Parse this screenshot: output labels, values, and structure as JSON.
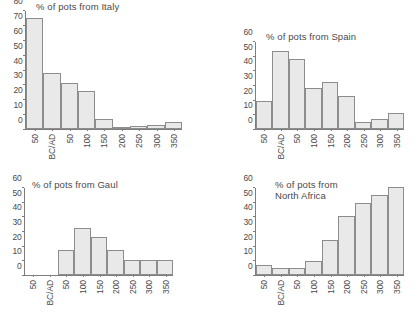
{
  "figure": {
    "panels": [
      "italy",
      "spain",
      "gaul",
      "north_africa"
    ]
  },
  "chart_data": [
    {
      "id": "italy",
      "type": "bar",
      "title": "% of pots from Italy",
      "xlabel": "",
      "ylabel": "",
      "ylim": [
        0,
        80
      ],
      "yticks": [
        0,
        10,
        20,
        30,
        40,
        50,
        60,
        70,
        80
      ],
      "grid": false,
      "legend": "none",
      "categories": [
        "50",
        "BC/AD",
        "50",
        "100",
        "150",
        "200",
        "250",
        "300",
        "350"
      ],
      "values": [
        75.5,
        38,
        31,
        25.5,
        6.5,
        1,
        2,
        3,
        5
      ]
    },
    {
      "id": "spain",
      "type": "bar",
      "title": "% of pots from Spain",
      "xlabel": "",
      "ylabel": "",
      "ylim": [
        0,
        60
      ],
      "yticks": [
        0,
        10,
        20,
        30,
        40,
        50,
        60
      ],
      "grid": false,
      "legend": "none",
      "categories": [
        "50",
        "BC/AD",
        "50",
        "100",
        "150",
        "200",
        "250",
        "300",
        "350"
      ],
      "values": [
        19,
        53.5,
        48.5,
        28.5,
        32.5,
        23,
        5,
        7,
        11
      ]
    },
    {
      "id": "gaul",
      "type": "bar",
      "title": "% of pots from Gaul",
      "xlabel": "",
      "ylabel": "",
      "ylim": [
        0,
        60
      ],
      "yticks": [
        0,
        10,
        20,
        30,
        40,
        50,
        60
      ],
      "grid": false,
      "legend": "none",
      "categories": [
        "50",
        "BC/AD",
        "50",
        "100",
        "150",
        "200",
        "250",
        "300",
        "350"
      ],
      "values": [
        0,
        0,
        17.5,
        32.5,
        26.5,
        17.5,
        10.5,
        10.5,
        10.5
      ]
    },
    {
      "id": "north_africa",
      "type": "bar",
      "title": "% of pots from\nNorth Africa",
      "xlabel": "",
      "ylabel": "",
      "ylim": [
        0,
        60
      ],
      "yticks": [
        0,
        10,
        20,
        30,
        40,
        50,
        60
      ],
      "grid": false,
      "legend": "none",
      "categories": [
        "50",
        "BC/AD",
        "50",
        "100",
        "150",
        "200",
        "250",
        "300",
        "350"
      ],
      "values": [
        7,
        4.5,
        4.5,
        9.5,
        24,
        40.5,
        49.5,
        55,
        60.5
      ]
    }
  ],
  "style": {
    "bar_fill": "#e9e9e9",
    "bar_stroke": "#8d8d8d",
    "axis_color": "#7d7d7d",
    "text_color": "#4a4a4a"
  }
}
